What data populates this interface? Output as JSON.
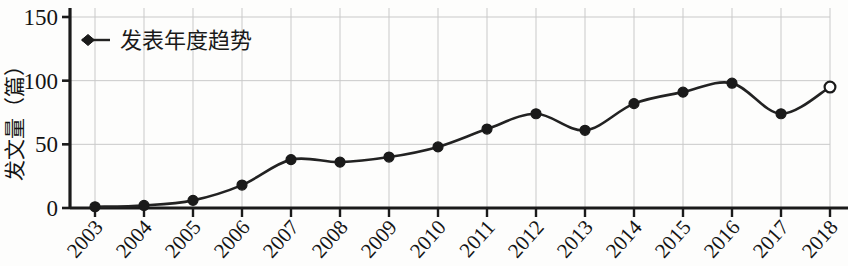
{
  "chart_data": {
    "type": "line",
    "title": "",
    "subtitle": "",
    "xlabel": "",
    "ylabel": "发文量（篇）",
    "categories": [
      "2003",
      "2004",
      "2005",
      "2006",
      "2007",
      "2008",
      "2009",
      "2010",
      "2011",
      "2012",
      "2013",
      "2014",
      "2015",
      "2016",
      "2017",
      "2018"
    ],
    "values": [
      1,
      2,
      6,
      18,
      38,
      36,
      40,
      48,
      62,
      74,
      61,
      82,
      91,
      98,
      74,
      95
    ],
    "series": [
      {
        "name": "发表年度趋势",
        "values": [
          1,
          2,
          6,
          18,
          38,
          36,
          40,
          48,
          62,
          74,
          61,
          82,
          91,
          98,
          74,
          95
        ]
      }
    ],
    "ylim": [
      0,
      150
    ],
    "yticks": [
      0,
      50,
      100,
      150
    ],
    "ytick_labels": [
      "0",
      "50",
      "100",
      "150"
    ],
    "xtick_rotation": 45,
    "grid": true,
    "grid_color": "#c9c9c9",
    "line_color": "#222222",
    "marker_color": "#1a1a1a",
    "marker_style": "filled-circle",
    "last_point_marker_style": "open-circle",
    "legend_position": "top-left-inside",
    "legend_marker": "diamond",
    "axes_drawn": [
      "left",
      "bottom"
    ]
  },
  "legend": {
    "entries": [
      {
        "label": "发表年度趋势",
        "marker": "diamond-marker-icon"
      }
    ]
  },
  "yaxis": {
    "label": "发文量（篇）",
    "ticks": [
      "0",
      "50",
      "100",
      "150"
    ]
  },
  "xaxis": {
    "ticks": [
      "2003",
      "2004",
      "2005",
      "2006",
      "2007",
      "2008",
      "2009",
      "2010",
      "2011",
      "2012",
      "2013",
      "2014",
      "2015",
      "2016",
      "2017",
      "2018"
    ]
  }
}
